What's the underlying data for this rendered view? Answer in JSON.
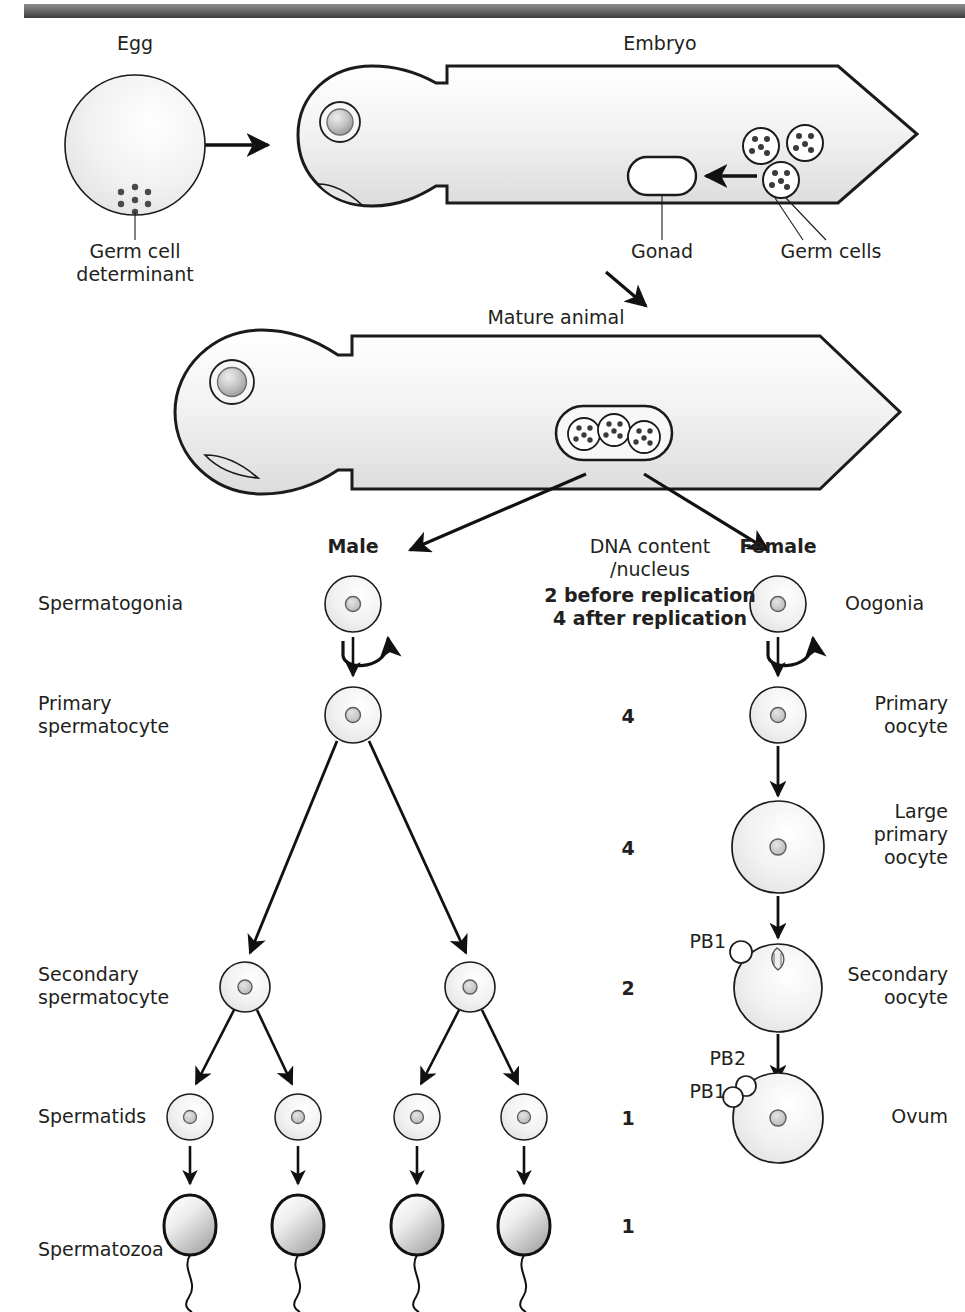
{
  "top_section": {
    "egg_label": "Egg",
    "germ_cell_determinant_label": "Germ cell\ndeterminant",
    "embryo_label": "Embryo",
    "gonad_label": "Gonad",
    "germ_cells_label": "Germ cells"
  },
  "middle_section": {
    "mature_animal_label": "Mature animal"
  },
  "branch": {
    "male_label": "Male",
    "female_label": "Female"
  },
  "dna_column": {
    "header_line1": "DNA content",
    "header_line2": "/nucleus",
    "note_line1": "2 before replication",
    "note_line2": "4 after replication",
    "values": [
      {
        "stage": "primary",
        "value": "4"
      },
      {
        "stage": "large-primary-oocyte",
        "value": "4"
      },
      {
        "stage": "secondary",
        "value": "2"
      },
      {
        "stage": "spermatids-ovum",
        "value": "1"
      },
      {
        "stage": "spermatozoa",
        "value": "1"
      }
    ]
  },
  "male_labels": [
    {
      "name": "spermatogonia",
      "text": "Spermatogonia"
    },
    {
      "name": "primary-spermatocyte",
      "text": "Primary\nspermatocyte"
    },
    {
      "name": "secondary-spermatocyte",
      "text": "Secondary\nspermatocyte"
    },
    {
      "name": "spermatids",
      "text": "Spermatids"
    },
    {
      "name": "spermatozoa",
      "text": "Spermatozoa"
    }
  ],
  "female_labels": [
    {
      "name": "oogonia",
      "text": "Oogonia"
    },
    {
      "name": "primary-oocyte",
      "text": "Primary\noocyte"
    },
    {
      "name": "large-primary-oocyte",
      "text": "Large\nprimary\noocyte"
    },
    {
      "name": "secondary-oocyte",
      "text": "Secondary\noocyte"
    },
    {
      "name": "ovum",
      "text": "Ovum"
    }
  ],
  "polar_bodies": [
    {
      "name": "pb1-secondary-oocyte",
      "text": "PB1"
    },
    {
      "name": "pb2-ovum",
      "text": "PB2"
    },
    {
      "name": "pb1-ovum",
      "text": "PB1"
    }
  ],
  "colors": {
    "ink": "#231f20",
    "outline": "#1b1b1b",
    "cell_fill": "#f2f2f2",
    "nucleus_fill": "#c9c9c9",
    "body_fill": "#f4f4f4",
    "bar_dark": "#3c3c3c"
  }
}
